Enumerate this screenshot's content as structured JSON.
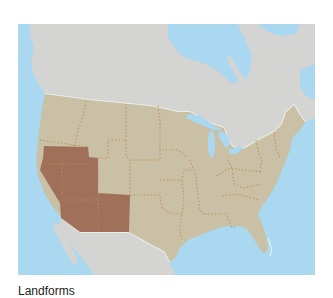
{
  "map": {
    "title": "North America map with highlighted U.S. southwest region",
    "colors": {
      "ocean": "#a9d8f0",
      "foreign_land": "#d4d4d2",
      "us_land": "#c9c0a6",
      "highlight": "#a0705a",
      "state_border": "#c6925a",
      "national_border": "#f4f4f0"
    },
    "highlighted_region": "Southwest (California, Nevada, Utah, Arizona, New Mexico area)"
  },
  "caption": {
    "text": "Landforms"
  }
}
